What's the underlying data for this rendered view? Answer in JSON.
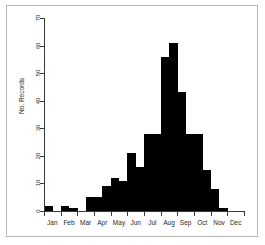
{
  "chart_data": {
    "type": "bar",
    "title": "",
    "subtitle": "",
    "xlabel": "",
    "ylabel": "No. Records",
    "ylim": [
      0,
      70
    ],
    "yticks": [
      0,
      10,
      20,
      30,
      40,
      50,
      60,
      70
    ],
    "grid": false,
    "legend": null,
    "annotations": [],
    "month_labels": [
      "Jan",
      "Feb",
      "Mar",
      "Apr",
      "May",
      "Jun",
      "Jul",
      "Aug",
      "Sep",
      "Oct",
      "Nov",
      "Dec"
    ],
    "bin_note": "half-month bins, 24 bins spanning Jan-Dec",
    "categories": [
      "Jan a",
      "Jan b",
      "Feb a",
      "Feb b",
      "Mar a",
      "Mar b",
      "Apr a",
      "Apr b",
      "May a",
      "May b",
      "Jun a",
      "Jun b",
      "Jul a",
      "Jul b",
      "Aug a",
      "Aug b",
      "Sep a",
      "Sep b",
      "Oct a",
      "Oct b",
      "Nov a",
      "Nov b",
      "Dec a",
      "Dec b"
    ],
    "values": [
      2,
      0,
      2,
      1,
      0,
      5,
      5,
      9,
      12,
      11,
      21,
      16,
      28,
      28,
      56,
      61,
      43,
      28,
      28,
      15,
      8,
      1,
      0,
      0
    ],
    "peak_value": 61,
    "peak_category": "Aug b"
  },
  "axis": {
    "y_labels": [
      "0",
      "10",
      "20",
      "30",
      "40",
      "50",
      "60",
      "70"
    ],
    "y_title": "No. Records",
    "x_labels": [
      "Jan",
      "Feb",
      "Mar",
      "Apr",
      "May",
      "Jun",
      "Jul",
      "Aug",
      "Sep",
      "Oct",
      "Nov",
      "Dec"
    ]
  },
  "colors": {
    "bar": "#000000",
    "axis": "#3a3a3a",
    "frame": "#b8b8b8",
    "background": "#ffffff",
    "text": "#1f1f1f"
  }
}
